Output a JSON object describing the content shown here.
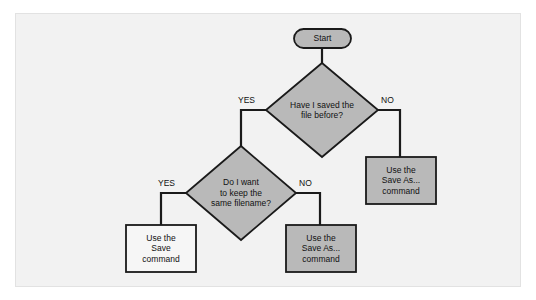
{
  "figure": {
    "type": "flowchart",
    "title_sliver": "",
    "panel": {
      "background_color": "#f2f2f2",
      "border_color": "#e2e2e2"
    },
    "colors": {
      "shape_fill_gray": "#b9b9b9",
      "shape_fill_white": "#f6f6f6",
      "stroke": "#1a1a1a",
      "text": "#111111"
    }
  },
  "nodes": {
    "start": {
      "label": "Start",
      "shape": "rounded-rectangle",
      "fill": "#b9b9b9"
    },
    "decision_saved_before": {
      "label": "Have I saved the\nfile before?",
      "shape": "diamond",
      "fill": "#b9b9b9"
    },
    "decision_same_filename": {
      "label": "Do I want\nto keep the\nsame filename?",
      "shape": "diamond",
      "fill": "#b9b9b9"
    },
    "process_save_as_right": {
      "label": "Use the\nSave As...\ncommand",
      "shape": "rectangle",
      "fill": "#b9b9b9"
    },
    "process_save": {
      "label": "Use the\nSave\ncommand",
      "shape": "rectangle",
      "fill": "#f6f6f6"
    },
    "process_save_as_middle": {
      "label": "Use the\nSave As...\ncommand",
      "shape": "rectangle",
      "fill": "#b9b9b9"
    }
  },
  "branch_labels": {
    "saved_before_yes": "YES",
    "saved_before_no": "NO",
    "same_filename_yes": "YES",
    "same_filename_no": "NO"
  },
  "edges": [
    {
      "from": "start",
      "to": "decision_saved_before",
      "label": ""
    },
    {
      "from": "decision_saved_before",
      "to": "decision_same_filename",
      "label": "YES"
    },
    {
      "from": "decision_saved_before",
      "to": "process_save_as_right",
      "label": "NO"
    },
    {
      "from": "decision_same_filename",
      "to": "process_save",
      "label": "YES"
    },
    {
      "from": "decision_same_filename",
      "to": "process_save_as_middle",
      "label": "NO"
    }
  ]
}
